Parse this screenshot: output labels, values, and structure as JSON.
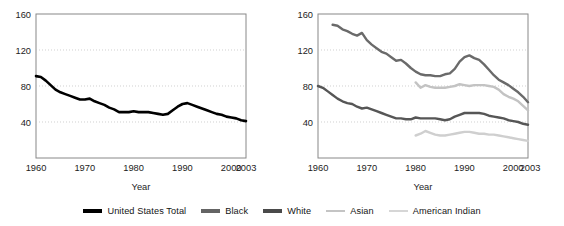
{
  "chart_data": [
    {
      "type": "line",
      "panel": "left",
      "title": "",
      "xlabel": "Year",
      "ylabel": "",
      "xlim": [
        1960,
        2003
      ],
      "ylim": [
        0,
        160
      ],
      "xticks": [
        1960,
        1970,
        1980,
        1990,
        2000,
        2003
      ],
      "yticks": [
        40,
        80,
        120,
        160
      ],
      "grid": "horizontal-dotted",
      "legend_position": "below-figure-shared",
      "series": [
        {
          "name": "United States Total",
          "color": "#000000",
          "x": [
            1960,
            1961,
            1962,
            1963,
            1964,
            1965,
            1966,
            1967,
            1968,
            1969,
            1970,
            1971,
            1972,
            1973,
            1974,
            1975,
            1976,
            1977,
            1978,
            1979,
            1980,
            1981,
            1982,
            1983,
            1984,
            1985,
            1986,
            1987,
            1988,
            1989,
            1990,
            1991,
            1992,
            1993,
            1994,
            1995,
            1996,
            1997,
            1998,
            1999,
            2000,
            2001,
            2002,
            2003
          ],
          "values": [
            91,
            90,
            86,
            81,
            76,
            73,
            71,
            69,
            67,
            65,
            65,
            66,
            63,
            61,
            59,
            56,
            54,
            51,
            51,
            51,
            52,
            51,
            51,
            51,
            50,
            49,
            48,
            49,
            53,
            57,
            60,
            61,
            59,
            57,
            55,
            53,
            51,
            49,
            48,
            46,
            45,
            44,
            42,
            41
          ]
        }
      ]
    },
    {
      "type": "line",
      "panel": "right",
      "title": "",
      "xlabel": "Year",
      "ylabel": "",
      "xlim": [
        1960,
        2003
      ],
      "ylim": [
        0,
        160
      ],
      "xticks": [
        1960,
        1970,
        1980,
        1990,
        2000,
        2003
      ],
      "yticks": [
        40,
        80,
        120,
        160
      ],
      "grid": "horizontal-dotted",
      "legend_position": "below-figure-shared",
      "series": [
        {
          "name": "Black",
          "color": "#646464",
          "x": [
            1963,
            1964,
            1965,
            1966,
            1967,
            1968,
            1969,
            1970,
            1971,
            1972,
            1973,
            1974,
            1975,
            1976,
            1977,
            1978,
            1979,
            1980,
            1981,
            1982,
            1983,
            1984,
            1985,
            1986,
            1987,
            1988,
            1989,
            1990,
            1991,
            1992,
            1993,
            1994,
            1995,
            1996,
            1997,
            1998,
            1999,
            2000,
            2001,
            2002,
            2003
          ],
          "values": [
            148,
            147,
            143,
            141,
            138,
            136,
            139,
            131,
            126,
            122,
            118,
            116,
            112,
            108,
            109,
            105,
            100,
            96,
            93,
            92,
            92,
            91,
            91,
            93,
            94,
            99,
            107,
            112,
            114,
            111,
            109,
            104,
            98,
            92,
            87,
            84,
            81,
            77,
            73,
            68,
            62
          ]
        },
        {
          "name": "White",
          "color": "#545454",
          "x": [
            1960,
            1961,
            1962,
            1963,
            1964,
            1965,
            1966,
            1967,
            1968,
            1969,
            1970,
            1971,
            1972,
            1973,
            1974,
            1975,
            1976,
            1977,
            1978,
            1979,
            1980,
            1981,
            1982,
            1983,
            1984,
            1985,
            1986,
            1987,
            1988,
            1989,
            1990,
            1991,
            1992,
            1993,
            1994,
            1995,
            1996,
            1997,
            1998,
            1999,
            2000,
            2001,
            2002,
            2003
          ],
          "values": [
            80,
            78,
            74,
            70,
            66,
            63,
            61,
            60,
            57,
            55,
            56,
            54,
            52,
            50,
            48,
            46,
            44,
            44,
            43,
            43,
            45,
            44,
            44,
            44,
            44,
            43,
            42,
            43,
            46,
            48,
            50,
            50,
            50,
            50,
            49,
            47,
            46,
            45,
            44,
            42,
            41,
            40,
            38,
            37
          ]
        },
        {
          "name": "Asian",
          "color": "#c8c8c8",
          "x": [
            1980,
            1981,
            1982,
            1983,
            1984,
            1985,
            1986,
            1987,
            1988,
            1989,
            1990,
            1991,
            1992,
            1993,
            1994,
            1995,
            1996,
            1997,
            1998,
            1999,
            2000,
            2001,
            2002,
            2003
          ],
          "values": [
            84,
            78,
            81,
            79,
            78,
            78,
            78,
            79,
            80,
            82,
            81,
            80,
            81,
            81,
            81,
            80,
            79,
            76,
            71,
            68,
            66,
            63,
            58,
            53
          ]
        },
        {
          "name": "American Indian",
          "color": "#c8c8c8",
          "x": [
            1980,
            1981,
            1982,
            1983,
            1984,
            1985,
            1986,
            1987,
            1988,
            1989,
            1990,
            1991,
            1992,
            1993,
            1994,
            1995,
            1996,
            1997,
            1998,
            1999,
            2000,
            2001,
            2002,
            2003
          ],
          "values": [
            25,
            27,
            30,
            28,
            26,
            25,
            25,
            26,
            27,
            28,
            29,
            29,
            28,
            27,
            27,
            26,
            26,
            25,
            24,
            23,
            22,
            21,
            20,
            19
          ]
        }
      ]
    }
  ],
  "left_panel": {
    "name": "left-chart",
    "yticks": [
      "160",
      "120",
      "80",
      "40"
    ],
    "xticks": [
      "1960",
      "1970",
      "1980",
      "1990",
      "2000",
      "2003"
    ],
    "xlabel": "Year"
  },
  "right_panel": {
    "name": "right-chart",
    "yticks": [
      "160",
      "120",
      "80",
      "40"
    ],
    "xticks": [
      "1960",
      "1970",
      "1980",
      "1990",
      "2000",
      "2003"
    ],
    "xlabel": "Year"
  },
  "legend": {
    "items": [
      {
        "label": "United States Total",
        "color": "#000000",
        "width": 4.2
      },
      {
        "label": "Black",
        "color": "#646464",
        "width": 3.4
      },
      {
        "label": "White",
        "color": "#4a4a4a",
        "width": 3.4
      },
      {
        "label": "Asian",
        "color": "#c4c4c4",
        "width": 2.6
      },
      {
        "label": "American Indian",
        "color": "#d6d6d6",
        "width": 2.6
      }
    ]
  }
}
